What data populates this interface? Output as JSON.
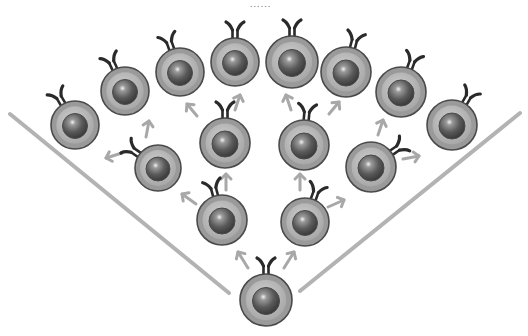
{
  "title_dots": "......",
  "colors": {
    "cell_outer": "#9a9a9a",
    "cell_ring": "#bdbdbd",
    "nucleus": "#5e5e5e",
    "outline": "#4a4a4a",
    "receptor": "#2a2a2a",
    "arrow": "#a8a8a8",
    "line": "#b3b3b3"
  },
  "boundary_lines": [
    {
      "x1": 10,
      "y1": 114,
      "x2": 229,
      "y2": 293
    },
    {
      "x1": 300,
      "y1": 291,
      "x2": 520,
      "y2": 113
    }
  ],
  "cells": [
    {
      "id": "root",
      "x": 266,
      "y": 300,
      "r": 26,
      "rot": 0
    },
    {
      "id": "lower-left",
      "x": 222,
      "y": 220,
      "r": 25,
      "rot": -15
    },
    {
      "id": "lower-right",
      "x": 305,
      "y": 222,
      "r": 24,
      "rot": 20
    },
    {
      "id": "mid-1",
      "x": 158,
      "y": 168,
      "r": 23,
      "rot": -55
    },
    {
      "id": "mid-2",
      "x": 225,
      "y": 143,
      "r": 25,
      "rot": 0
    },
    {
      "id": "mid-3",
      "x": 304,
      "y": 145,
      "r": 25,
      "rot": 5
    },
    {
      "id": "mid-4",
      "x": 371,
      "y": 167,
      "r": 25,
      "rot": 55
    },
    {
      "id": "outer-1",
      "x": 75,
      "y": 125,
      "r": 24,
      "rot": -30
    },
    {
      "id": "outer-2",
      "x": 125,
      "y": 91,
      "r": 24,
      "rot": -25
    },
    {
      "id": "outer-3",
      "x": 180,
      "y": 72,
      "r": 24,
      "rot": -20
    },
    {
      "id": "outer-4",
      "x": 235,
      "y": 62,
      "r": 24,
      "rot": 0
    },
    {
      "id": "outer-5",
      "x": 292,
      "y": 62,
      "r": 26,
      "rot": 0
    },
    {
      "id": "outer-6",
      "x": 346,
      "y": 72,
      "r": 25,
      "rot": 15
    },
    {
      "id": "outer-7",
      "x": 401,
      "y": 92,
      "r": 25,
      "rot": 20
    },
    {
      "id": "outer-8",
      "x": 452,
      "y": 125,
      "r": 25,
      "rot": 30
    }
  ],
  "arrows": [
    {
      "x1": 248,
      "y1": 268,
      "x2": 238,
      "y2": 252
    },
    {
      "x1": 284,
      "y1": 268,
      "x2": 294,
      "y2": 252
    },
    {
      "x1": 196,
      "y1": 204,
      "x2": 182,
      "y2": 194
    },
    {
      "x1": 226,
      "y1": 190,
      "x2": 226,
      "y2": 174
    },
    {
      "x1": 300,
      "y1": 190,
      "x2": 300,
      "y2": 174
    },
    {
      "x1": 328,
      "y1": 207,
      "x2": 344,
      "y2": 200
    },
    {
      "x1": 122,
      "y1": 153,
      "x2": 106,
      "y2": 158
    },
    {
      "x1": 146,
      "y1": 137,
      "x2": 149,
      "y2": 121
    },
    {
      "x1": 197,
      "y1": 116,
      "x2": 187,
      "y2": 104
    },
    {
      "x1": 235,
      "y1": 110,
      "x2": 240,
      "y2": 95
    },
    {
      "x1": 291,
      "y1": 110,
      "x2": 286,
      "y2": 95
    },
    {
      "x1": 329,
      "y1": 114,
      "x2": 339,
      "y2": 102
    },
    {
      "x1": 378,
      "y1": 135,
      "x2": 383,
      "y2": 120
    },
    {
      "x1": 403,
      "y1": 159,
      "x2": 419,
      "y2": 156
    }
  ]
}
